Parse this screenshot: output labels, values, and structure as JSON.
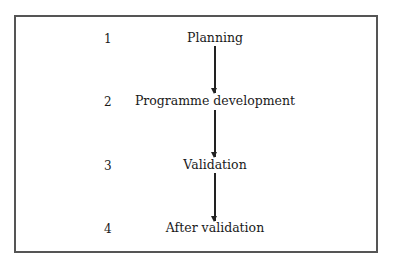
{
  "diagram": {
    "type": "flowchart",
    "steps": [
      {
        "number": "1",
        "label": "Planning"
      },
      {
        "number": "2",
        "label": "Programme development"
      },
      {
        "number": "3",
        "label": "Validation"
      },
      {
        "number": "4",
        "label": "After validation"
      }
    ],
    "connections": [
      {
        "from": "Planning",
        "to": "Programme development"
      },
      {
        "from": "Programme development",
        "to": "Validation"
      },
      {
        "from": "Validation",
        "to": "After validation"
      }
    ]
  }
}
